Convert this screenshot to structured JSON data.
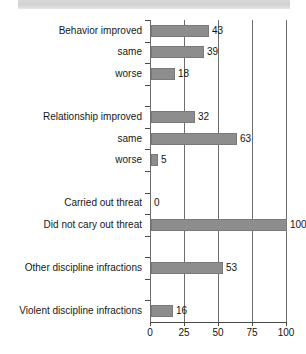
{
  "title": {
    "text": "threats",
    "banner_color": "#d4d4d4"
  },
  "chart_data": {
    "type": "bar",
    "orientation": "horizontal",
    "title": "threats",
    "xlabel": "",
    "ylabel": "",
    "xlim": [
      0,
      100
    ],
    "xticks": [
      0,
      25,
      50,
      75,
      100
    ],
    "xtick_labels": [
      "0",
      "25",
      "50",
      "75",
      "100"
    ],
    "grid": true,
    "legend": false,
    "bar_color": "#8d8d8d",
    "categories": [
      "Behavior improved",
      "same",
      "worse",
      "",
      "Relationship improved",
      "same",
      "worse",
      "",
      "Carried out threat",
      "Did not cary out threat",
      "",
      "Other discipline infractions",
      "",
      "Violent discipline infractions"
    ],
    "values": [
      43,
      39,
      18,
      null,
      32,
      63,
      5,
      null,
      0,
      100,
      null,
      53,
      null,
      16
    ],
    "value_labels": [
      "43",
      "39",
      "18",
      "",
      "32",
      "63",
      "5",
      "",
      "0",
      "100",
      "",
      "53",
      "",
      "16"
    ]
  },
  "rows": [
    {
      "label": "Behavior improved",
      "value": 43,
      "value_label": "43",
      "has_bar": true
    },
    {
      "label": "same",
      "value": 39,
      "value_label": "39",
      "has_bar": true
    },
    {
      "label": "worse",
      "value": 18,
      "value_label": "18",
      "has_bar": true
    },
    {
      "label": "",
      "value": null,
      "value_label": "",
      "has_bar": false
    },
    {
      "label": "Relationship improved",
      "value": 32,
      "value_label": "32",
      "has_bar": true
    },
    {
      "label": "same",
      "value": 63,
      "value_label": "63",
      "has_bar": true
    },
    {
      "label": "worse",
      "value": 5,
      "value_label": "5",
      "has_bar": true
    },
    {
      "label": "",
      "value": null,
      "value_label": "",
      "has_bar": false
    },
    {
      "label": "Carried out threat",
      "value": 0,
      "value_label": "0",
      "has_bar": false
    },
    {
      "label": "Did not cary out threat",
      "value": 100,
      "value_label": "100",
      "has_bar": true
    },
    {
      "label": "",
      "value": null,
      "value_label": "",
      "has_bar": false
    },
    {
      "label": "Other discipline infractions",
      "value": 53,
      "value_label": "53",
      "has_bar": true
    },
    {
      "label": "",
      "value": null,
      "value_label": "",
      "has_bar": false
    },
    {
      "label": "Violent discipline infractions",
      "value": 16,
      "value_label": "16",
      "has_bar": true
    }
  ],
  "axis": {
    "ticks": [
      "0",
      "25",
      "50",
      "75",
      "100"
    ]
  }
}
